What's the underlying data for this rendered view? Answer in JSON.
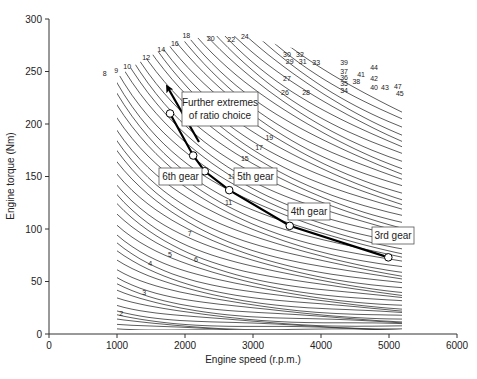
{
  "chart_data": {
    "type": "line",
    "title": "",
    "xlabel": "Engine speed (r.p.m.)",
    "ylabel": "Engine torque (Nm)",
    "xlim": [
      0,
      6000
    ],
    "ylim": [
      0,
      300
    ],
    "xticks": [
      0,
      1000,
      2000,
      3000,
      4000,
      5000,
      6000
    ],
    "yticks": [
      0,
      50,
      100,
      150,
      200,
      250,
      300
    ],
    "grid": false,
    "legend": null,
    "series": [
      {
        "name": "Gear ratio operating points",
        "x": [
          1780,
          2120,
          2290,
          2650,
          3540,
          4990
        ],
        "y": [
          210,
          170,
          155,
          137,
          103,
          73
        ],
        "marker": "open-circle",
        "line": "thick-black"
      }
    ],
    "contour_map": {
      "description": "Engine map iso-lines (numbered contours)",
      "x_range_rpm": [
        900,
        5200
      ],
      "labels": [
        {
          "text": "2",
          "x": 1060,
          "y": 17
        },
        {
          "text": "3",
          "x": 1400,
          "y": 37
        },
        {
          "text": "4",
          "x": 1490,
          "y": 65
        },
        {
          "text": "5",
          "x": 1780,
          "y": 73
        },
        {
          "text": "6",
          "x": 2160,
          "y": 69
        },
        {
          "text": "7",
          "x": 2070,
          "y": 93
        },
        {
          "text": "8",
          "x": 820,
          "y": 246
        },
        {
          "text": "9",
          "x": 990,
          "y": 249
        },
        {
          "text": "10",
          "x": 1150,
          "y": 252
        },
        {
          "text": "11",
          "x": 2640,
          "y": 123
        },
        {
          "text": "12",
          "x": 1430,
          "y": 261
        },
        {
          "text": "13",
          "x": 2690,
          "y": 148
        },
        {
          "text": "14",
          "x": 1650,
          "y": 269
        },
        {
          "text": "15",
          "x": 2880,
          "y": 165
        },
        {
          "text": "16",
          "x": 1850,
          "y": 274
        },
        {
          "text": "17",
          "x": 3090,
          "y": 175
        },
        {
          "text": "18",
          "x": 2020,
          "y": 282
        },
        {
          "text": "19",
          "x": 3240,
          "y": 185
        },
        {
          "text": "20",
          "x": 2380,
          "y": 279
        },
        {
          "text": "22",
          "x": 2680,
          "y": 278
        },
        {
          "text": "24",
          "x": 2880,
          "y": 281
        },
        {
          "text": "26",
          "x": 3470,
          "y": 228
        },
        {
          "text": "27",
          "x": 3500,
          "y": 241
        },
        {
          "text": "28",
          "x": 3780,
          "y": 228
        },
        {
          "text": "29",
          "x": 3540,
          "y": 257
        },
        {
          "text": "30",
          "x": 3500,
          "y": 264
        },
        {
          "text": "31",
          "x": 3730,
          "y": 257
        },
        {
          "text": "32",
          "x": 3690,
          "y": 264
        },
        {
          "text": "33",
          "x": 3930,
          "y": 256
        },
        {
          "text": "34",
          "x": 4340,
          "y": 230
        },
        {
          "text": "35",
          "x": 4340,
          "y": 236
        },
        {
          "text": "36",
          "x": 4340,
          "y": 242
        },
        {
          "text": "37",
          "x": 4340,
          "y": 248
        },
        {
          "text": "38",
          "x": 4520,
          "y": 238
        },
        {
          "text": "39",
          "x": 4340,
          "y": 256
        },
        {
          "text": "40",
          "x": 4780,
          "y": 232
        },
        {
          "text": "41",
          "x": 4590,
          "y": 245
        },
        {
          "text": "42",
          "x": 4780,
          "y": 241
        },
        {
          "text": "43",
          "x": 4940,
          "y": 232
        },
        {
          "text": "44",
          "x": 4780,
          "y": 251
        },
        {
          "text": "45",
          "x": 5160,
          "y": 227
        },
        {
          "text": "47",
          "x": 5130,
          "y": 233
        }
      ]
    },
    "annotations": [
      {
        "text": "6th gear",
        "x": 1640,
        "y": 156
      },
      {
        "text": "5th gear",
        "x": 2820,
        "y": 156
      },
      {
        "text": "4th gear",
        "x": 3720,
        "y": 114
      },
      {
        "text": "3rd gear",
        "x": 5050,
        "y": 87
      },
      {
        "text": "Further extremes of ratio choice",
        "x": 2700,
        "y": 225,
        "arrow_from": [
          2200,
          175
        ],
        "arrow_to": [
          1700,
          240
        ]
      }
    ]
  },
  "annotation_labels": {
    "further_line1": "Further extremes",
    "further_line2": "of ratio choice",
    "gear6": "6th gear",
    "gear5": "5th gear",
    "gear4": "4th gear",
    "gear3": "3rd gear"
  },
  "axes": {
    "xlabel": "Engine speed (r.p.m.)",
    "ylabel": "Engine torque (Nm)"
  }
}
